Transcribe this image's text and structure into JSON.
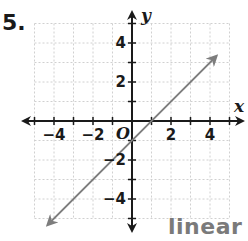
{
  "problem": {
    "number_label": "5."
  },
  "answer": {
    "text": "linear"
  },
  "chart_data": {
    "type": "line",
    "title": "",
    "xlabel": "x",
    "ylabel": "y",
    "origin_label": "O",
    "xlim": [
      -5,
      5
    ],
    "ylim": [
      -5,
      5
    ],
    "grid": true,
    "x_tick_labels": [
      "−4",
      "−2",
      "2",
      "4"
    ],
    "x_tick_values": [
      -4,
      -2,
      2,
      4
    ],
    "y_tick_labels": [
      "4",
      "2",
      "−2",
      "−4"
    ],
    "y_tick_values": [
      4,
      2,
      -2,
      -4
    ],
    "series": [
      {
        "name": "y = x − 1",
        "x": [
          -4.2,
          0,
          1,
          4.2
        ],
        "y": [
          -5.2,
          -1,
          0,
          3.2
        ],
        "arrows_both_ends": true
      }
    ],
    "colors": {
      "line": "#7d7d7d",
      "axis": "#1a1a1a",
      "grid": "#d0d0d0"
    }
  }
}
